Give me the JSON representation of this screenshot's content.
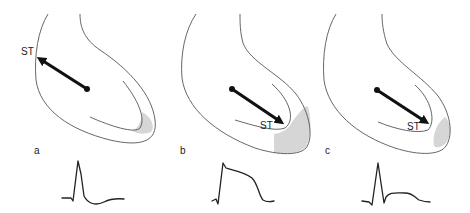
{
  "figure": {
    "colors": {
      "outline": "#555555",
      "vector": "#111111",
      "shade": "#d6d6d6",
      "ecg": "#222222"
    },
    "panels": [
      {
        "id": "a",
        "label": "a",
        "vector_label": "ST",
        "vector_direction": "away from injury (toward base/upper-left)",
        "injury_region": "subendocardial apex",
        "ecg_morphology": "QRS with ST depression"
      },
      {
        "id": "b",
        "label": "b",
        "vector_label": "ST",
        "vector_direction": "toward injury (apex)",
        "injury_region": "transmural apex",
        "ecg_morphology": "marked ST elevation (monophasic)"
      },
      {
        "id": "c",
        "label": "c",
        "vector_label": "ST",
        "vector_direction": "toward injury (apex)",
        "injury_region": "subepicardial apex",
        "ecg_morphology": "QRS with mild ST elevation"
      }
    ]
  }
}
